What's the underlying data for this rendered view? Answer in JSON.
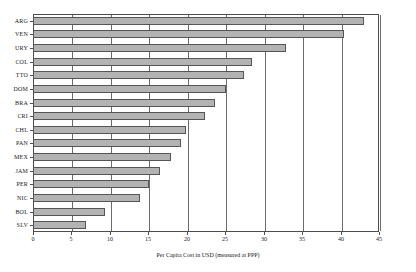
{
  "chart_data": {
    "type": "bar",
    "orientation": "horizontal",
    "title": "",
    "xlabel": "Per Capita Cost in USD (measured at PPP)",
    "ylabel": "",
    "categories": [
      "ARG",
      "VEN",
      "URY",
      "COL",
      "TTO",
      "DOM",
      "BRA",
      "CRI",
      "CHL",
      "PAN",
      "MEX",
      "JAM",
      "PER",
      "NIC",
      "BOL",
      "SLV"
    ],
    "values": [
      43.0,
      40.5,
      32.9,
      28.5,
      27.5,
      25.1,
      23.7,
      22.4,
      19.9,
      19.2,
      18.0,
      16.5,
      15.1,
      13.9,
      9.4,
      6.9
    ],
    "xlim": [
      0,
      45
    ],
    "xticks": [
      0,
      5,
      10,
      15,
      20,
      25,
      30,
      35,
      40,
      45
    ],
    "xtick_labels": [
      "0",
      "5",
      "10",
      "15",
      "20",
      "25",
      "30",
      "35",
      "40",
      "45"
    ],
    "grid": "vertical",
    "legend": "none",
    "bar_fill_color": "#b3b3b3",
    "bar_border_color": "#555555",
    "axis_color": "#4d4d4d",
    "background_color": "#ffffff"
  }
}
